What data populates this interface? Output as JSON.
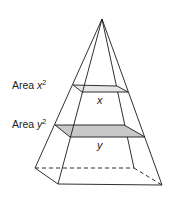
{
  "diagram": {
    "type": "pyramid cross-section",
    "labels": {
      "upper_area_prefix": "Area ",
      "upper_area_var": "x",
      "upper_area_exp": "2",
      "lower_area_prefix": "Area ",
      "lower_area_var": "y",
      "lower_area_exp": "2",
      "upper_side": "x",
      "lower_side": "y"
    },
    "colors": {
      "stroke": "#1a1a1a",
      "lower_section_fill": "#c8c8c8",
      "upper_section_fill": "#e6e6e6"
    }
  }
}
